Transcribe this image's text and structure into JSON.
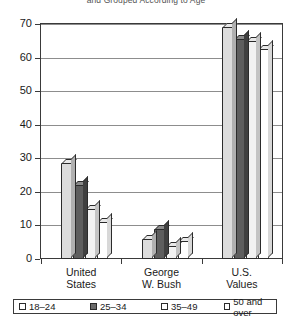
{
  "chart_data": {
    "type": "bar",
    "title": "and Grouped According to Age",
    "xlabel": "",
    "ylabel": "",
    "ylim": [
      0,
      70
    ],
    "yticks": [
      0,
      10,
      20,
      30,
      40,
      50,
      60,
      70
    ],
    "grid": true,
    "legend_position": "bottom",
    "categories": [
      "United States",
      "George W. Bush",
      "U.S. Values"
    ],
    "category_lines": [
      [
        "United",
        "States"
      ],
      [
        "George",
        "W. Bush"
      ],
      [
        "U.S.",
        "Values"
      ]
    ],
    "series": [
      {
        "name": "18–24",
        "values": [
          28.5,
          6.0,
          69.0
        ]
      },
      {
        "name": "25–34",
        "values": [
          22.0,
          9.0,
          65.5
        ]
      },
      {
        "name": "35–49",
        "values": [
          15.0,
          4.0,
          65.0
        ]
      },
      {
        "name": "50 and over",
        "values": [
          11.0,
          5.5,
          62.5
        ]
      }
    ]
  },
  "legend": {
    "items": [
      {
        "label": "18–24"
      },
      {
        "label": "25–34"
      },
      {
        "label": "35–49"
      },
      {
        "label": "50 and over"
      }
    ]
  },
  "axis": {
    "y_labels": [
      "70",
      "60",
      "50",
      "40",
      "30",
      "20",
      "10",
      "0"
    ]
  }
}
